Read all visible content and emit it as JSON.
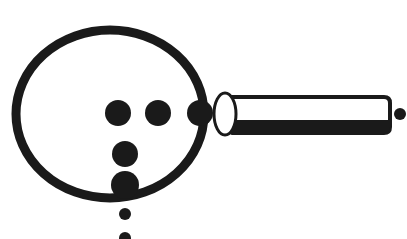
{
  "image": {
    "title": "Magnifying glass line drawing with dots",
    "width": 407,
    "height": 239,
    "background_color": "#ffffff",
    "ink_color": "#1a1a1a",
    "style": "scanned black-and-white ink illustration",
    "alt_text": "A thick black outlined circle with a tapering handle to the right, containing several solid black dots arranged in a horizontal row and a vertical column, with two small dots trailing below the circle and one small dot to the right of the handle tip."
  },
  "figure": {
    "lens_ring": {
      "name": "lens-ring",
      "center_x": 110,
      "center_y": 114,
      "radius_x": 94,
      "radius_y": 84,
      "stroke_width": 9,
      "fill": "none",
      "stroke": "#1a1a1a"
    },
    "ferrule": {
      "name": "ferrule-ellipse",
      "center_x": 225,
      "center_y": 114,
      "radius_x": 11,
      "radius_y": 21,
      "fill": "#ffffff",
      "stroke": "#1a1a1a",
      "stroke_width": 3
    },
    "handle": {
      "name": "handle-bar",
      "x": 232,
      "y": 97,
      "width": 158,
      "height": 36,
      "corner_radius": 6,
      "fill": "#ffffff",
      "stroke": "#1a1a1a",
      "top_stroke_width": 4,
      "bottom_band_height": 13,
      "bottom_band_fill": "#1a1a1a"
    },
    "dots": [
      {
        "name": "lens-dot-row-1",
        "cx": 118,
        "cy": 113,
        "r": 13,
        "group": "row"
      },
      {
        "name": "lens-dot-row-2",
        "cx": 158,
        "cy": 113,
        "r": 13,
        "group": "row"
      },
      {
        "name": "lens-dot-row-3",
        "cx": 200,
        "cy": 113,
        "r": 13,
        "group": "row"
      },
      {
        "name": "lens-dot-col-1",
        "cx": 125,
        "cy": 154,
        "r": 13,
        "group": "column"
      },
      {
        "name": "lens-dot-col-2",
        "cx": 125,
        "cy": 185,
        "r": 14,
        "group": "column"
      },
      {
        "name": "trailing-dot-1",
        "cx": 125,
        "cy": 214,
        "r": 6,
        "group": "trailing"
      },
      {
        "name": "trailing-dot-2",
        "cx": 125,
        "cy": 238,
        "r": 6,
        "group": "trailing"
      },
      {
        "name": "handle-tip-dot",
        "cx": 400,
        "cy": 114,
        "r": 6,
        "group": "tip"
      }
    ]
  },
  "counts": {
    "total_dots": 8,
    "row_dots": 3,
    "column_dots": 2,
    "trailing_dots": 2,
    "tip_dots": 1
  }
}
